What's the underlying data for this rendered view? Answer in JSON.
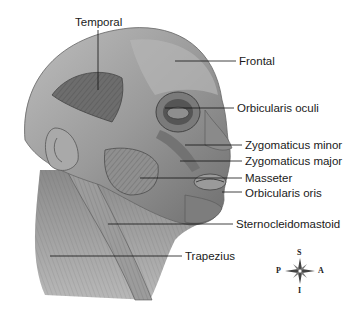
{
  "figure": {
    "labels": [
      {
        "id": "temporal",
        "text": "Temporal",
        "x": 66,
        "y": 15,
        "line": {
          "x1": 98,
          "y1": 30,
          "x2": 98,
          "y2": 90
        }
      },
      {
        "id": "frontal",
        "text": "Frontal",
        "x": 239,
        "y": 57,
        "line": {
          "x1": 175,
          "y1": 61,
          "x2": 236,
          "y2": 61
        }
      },
      {
        "id": "orbicularis-oculi",
        "text": "Orbicularis oculi",
        "x": 237,
        "y": 104,
        "line": {
          "x1": 165,
          "y1": 108,
          "x2": 234,
          "y2": 108
        }
      },
      {
        "id": "zygomaticus-minor",
        "text": "Zygomaticus minor",
        "x": 245,
        "y": 140,
        "line": {
          "x1": 185,
          "y1": 145,
          "x2": 242,
          "y2": 145
        }
      },
      {
        "id": "zygomaticus-major",
        "text": "Zygomaticus major",
        "x": 245,
        "y": 155,
        "line": {
          "x1": 180,
          "y1": 161,
          "x2": 242,
          "y2": 161
        }
      },
      {
        "id": "masseter",
        "text": "Masseter",
        "x": 245,
        "y": 172,
        "line": {
          "x1": 140,
          "y1": 178,
          "x2": 242,
          "y2": 178
        }
      },
      {
        "id": "orbicularis-oris",
        "text": "Orbicularis oris",
        "x": 245,
        "y": 187,
        "line": {
          "x1": 222,
          "y1": 192,
          "x2": 242,
          "y2": 192
        }
      },
      {
        "id": "sternocleidomastoid",
        "text": "Sternocleidomastoid",
        "x": 236,
        "y": 219,
        "line": {
          "x1": 108,
          "y1": 224,
          "x2": 233,
          "y2": 224
        }
      },
      {
        "id": "trapezius",
        "text": "Trapezius",
        "x": 185,
        "y": 251,
        "line": {
          "x1": 50,
          "y1": 256,
          "x2": 182,
          "y2": 256
        }
      }
    ],
    "compass": {
      "superior": "S",
      "inferior": "I",
      "posterior": "P",
      "anterior": "A"
    }
  }
}
